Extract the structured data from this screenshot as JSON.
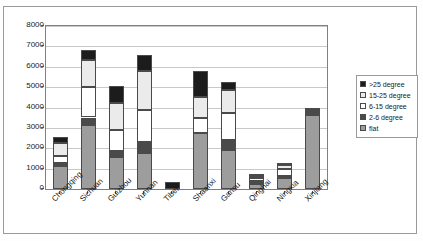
{
  "chart_data": {
    "type": "bar",
    "stacked": true,
    "title": "",
    "xlabel": "",
    "ylabel": "",
    "ylim": [
      0,
      8000
    ],
    "ytick_step": 1000,
    "yticks": [
      8000,
      7000,
      6000,
      5000,
      4000,
      3000,
      2000,
      1000,
      0
    ],
    "grid": true,
    "legend_position": "right",
    "categories": [
      "Chongqing",
      "Sichuan",
      "Guizhou",
      "Yunnan",
      "Tibet",
      "Shaanxi",
      "Gansu",
      "Qinghai",
      "Ningxia",
      "Xinjiang"
    ],
    "series": [
      {
        "name": "flat",
        "color": "#9d9d9d",
        "values": [
          1150,
          3150,
          1550,
          1780,
          0,
          2770,
          1930,
          270,
          560,
          3650
        ]
      },
      {
        "name": "2-6 degree",
        "color": "#4a4a4a",
        "values": [
          110,
          360,
          300,
          520,
          0,
          0,
          470,
          110,
          100,
          120
        ]
      },
      {
        "name": "6-15 degree",
        "color": "#ffffff",
        "values": [
          370,
          1500,
          1050,
          1600,
          0,
          730,
          1350,
          150,
          330,
          50
        ]
      },
      {
        "name": "15-25 degree",
        "color": "#ebebeb",
        "values": [
          620,
          1300,
          1300,
          1880,
          0,
          1000,
          1120,
          100,
          170,
          40
        ]
      },
      {
        "name": ">25 degree",
        "color": "#1c1c1c",
        "values": [
          300,
          500,
          880,
          780,
          350,
          1280,
          360,
          50,
          70,
          40
        ]
      }
    ],
    "totals": [
      2550,
      6810,
      5080,
      6560,
      350,
      5780,
      5230,
      680,
      1230,
      3900
    ]
  },
  "legend": {
    "items": [
      {
        "label": ">25 degree",
        "swatch": "legend-swatch-25"
      },
      {
        "label": "15-25 degree",
        "swatch": "legend-swatch-15-25"
      },
      {
        "label": "6-15 degree",
        "swatch": "legend-swatch-6-15"
      },
      {
        "label": "2-6 degree",
        "swatch": "legend-swatch-2-6"
      },
      {
        "label": "flat",
        "swatch": "legend-swatch-flat"
      }
    ]
  }
}
